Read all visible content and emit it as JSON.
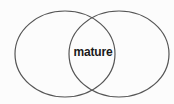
{
  "diagram": {
    "type": "venn",
    "sets": [
      {
        "name": "left-set",
        "label": ""
      },
      {
        "name": "right-set",
        "label": ""
      }
    ],
    "intersection_label": "mature",
    "stroke_color": "#555555",
    "background": "#fcfcfc"
  }
}
